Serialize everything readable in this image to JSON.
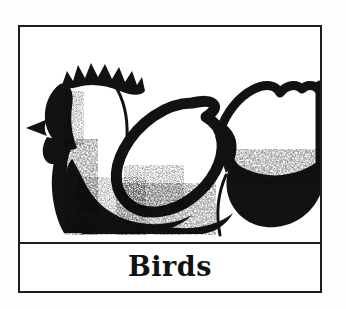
{
  "page": {
    "background_color": "#fefefe",
    "type": "clip-art-illustration-card"
  },
  "card": {
    "border_color": "#1d1d1d",
    "background_color": "#ffffff"
  },
  "illustration": {
    "subject": "rooster",
    "style": "black-and-white woodcut clip art silhouette",
    "ink_color": "#121212",
    "paper_color": "#ffffff",
    "parts": [
      "comb",
      "beak",
      "wattle",
      "neck",
      "breast",
      "wing",
      "tail"
    ]
  },
  "caption": {
    "label": "Birds",
    "color": "#121212"
  }
}
